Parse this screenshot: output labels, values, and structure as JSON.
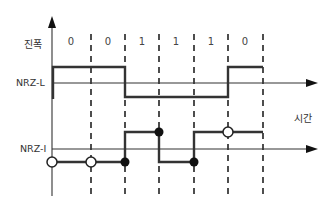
{
  "labels": {
    "amplitude": "진폭",
    "nrz_l": "NRZ-L",
    "nrz_i": "NRZ-I",
    "time": "시간"
  },
  "bits": [
    "0",
    "0",
    "1",
    "1",
    "1",
    "0"
  ],
  "colors": {
    "line": "#222222",
    "axis": "#333333"
  }
}
